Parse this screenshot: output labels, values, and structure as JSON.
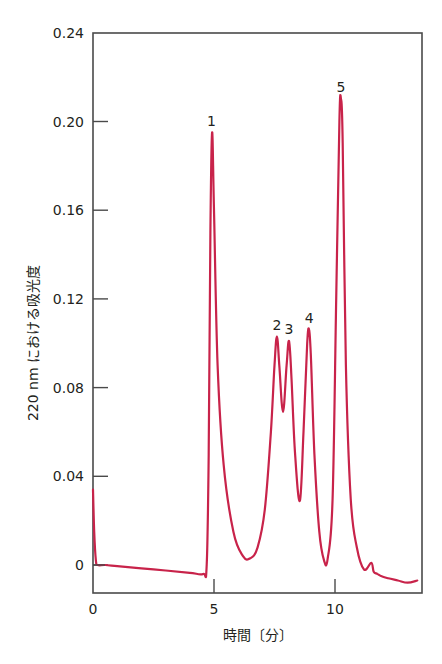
{
  "chart_data": {
    "type": "line",
    "title": "",
    "xlabel": "時間〔分〕",
    "ylabel": "220 nm における吸光度",
    "xlim": [
      0,
      13.6
    ],
    "ylim": [
      -0.013,
      0.24
    ],
    "x_ticks": [
      0,
      5,
      10
    ],
    "x_tick_labels": [
      "0",
      "5",
      "10"
    ],
    "y_ticks": [
      0,
      0.04,
      0.08,
      0.12,
      0.16,
      0.2,
      0.24
    ],
    "y_tick_labels": [
      "0",
      "0.04",
      "0.08",
      "0.12",
      "0.16",
      "0.20",
      "0.24"
    ],
    "grid": false,
    "legend": null,
    "line_color": "#c8234a",
    "series": [
      {
        "name": "chromatogram",
        "x": [
          0.0,
          0.05,
          0.12,
          0.2,
          0.5,
          1.0,
          2.0,
          3.0,
          4.0,
          4.55,
          4.7,
          4.78,
          4.85,
          4.92,
          5.0,
          5.15,
          5.4,
          5.8,
          6.2,
          6.5,
          6.8,
          7.1,
          7.35,
          7.5,
          7.6,
          7.7,
          7.85,
          8.0,
          8.1,
          8.2,
          8.35,
          8.55,
          8.7,
          8.85,
          8.93,
          9.0,
          9.15,
          9.35,
          9.55,
          9.7,
          9.9,
          10.05,
          10.18,
          10.25,
          10.32,
          10.45,
          10.65,
          10.9,
          11.2,
          11.5,
          11.6,
          11.75,
          11.9,
          12.2,
          12.6,
          13.0,
          13.4
        ],
        "y": [
          0.034,
          0.015,
          0.002,
          0.0,
          0.0,
          -0.0005,
          -0.0015,
          -0.0025,
          -0.0035,
          -0.004,
          0.0,
          0.05,
          0.15,
          0.195,
          0.16,
          0.09,
          0.045,
          0.015,
          0.004,
          0.003,
          0.008,
          0.025,
          0.06,
          0.09,
          0.103,
          0.09,
          0.069,
          0.09,
          0.101,
          0.085,
          0.05,
          0.029,
          0.06,
          0.1,
          0.106,
          0.095,
          0.05,
          0.015,
          0.002,
          0.003,
          0.03,
          0.12,
          0.2,
          0.21,
          0.19,
          0.09,
          0.03,
          0.008,
          -0.002,
          0.001,
          -0.003,
          -0.004,
          -0.005,
          -0.006,
          -0.007,
          -0.008,
          -0.007
        ]
      }
    ],
    "annotations": [
      {
        "text": "1",
        "x": 4.9,
        "y": 0.195
      },
      {
        "text": "2",
        "x": 7.6,
        "y": 0.103
      },
      {
        "text": "3",
        "x": 8.1,
        "y": 0.101
      },
      {
        "text": "4",
        "x": 8.93,
        "y": 0.106
      },
      {
        "text": "5",
        "x": 10.25,
        "y": 0.21
      }
    ]
  }
}
